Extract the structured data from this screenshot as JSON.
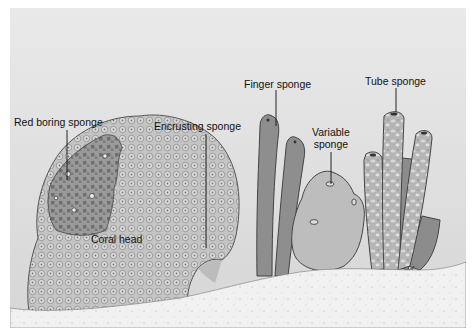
{
  "figure": {
    "style": "grayscale illustration",
    "colors": {
      "water": "#e2e2e2",
      "sand": "#f2f2f2",
      "coral": "#c9c9c9",
      "red_boring_patch": "#8c8c8c",
      "finger": "#8e8e8e",
      "variable": "#bdbdbd",
      "tube": "#b8b8b8",
      "label_text": "#111111"
    },
    "labels": [
      {
        "id": "red_boring",
        "text": "Red boring sponge"
      },
      {
        "id": "encrusting",
        "text": "Encrusting sponge"
      },
      {
        "id": "finger",
        "text": "Finger sponge"
      },
      {
        "id": "variable",
        "text": "Variable sponge",
        "lines": [
          "Variable",
          "sponge"
        ]
      },
      {
        "id": "tube",
        "text": "Tube sponge"
      },
      {
        "id": "coral_head",
        "text": "Coral head"
      }
    ]
  }
}
